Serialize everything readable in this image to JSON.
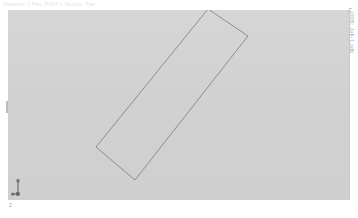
{
  "window": {
    "header_caption": "Viewport: 1    Part: PART-1    Module: Part",
    "background_color": "#d2d2d2",
    "outline_color": "#7a7a7a",
    "accent_color": "#9a9a9a"
  },
  "viewport": {
    "name": "Viewport 1",
    "left": 8,
    "top": 10,
    "width": 342,
    "height": 190
  },
  "geometry": {
    "shape_name": "rotated-rectangle-part",
    "label": "Part outline",
    "stroke_color": "#7b7b7b",
    "fill_color": "none",
    "stroke_width": 0.8,
    "points": [
      {
        "x": 208,
        "y": 9
      },
      {
        "x": 248,
        "y": 36
      },
      {
        "x": 135,
        "y": 180
      },
      {
        "x": 96,
        "y": 147
      }
    ]
  },
  "axis_triad": {
    "label": "2",
    "axis_labels": [
      "1",
      "2",
      "3"
    ],
    "color": "#6e6e6e"
  },
  "side_annotation": {
    "text": "ODB: Job-1.odb",
    "mark": "Z"
  },
  "left_tick": {
    "name": "viewport-edge-tick"
  }
}
